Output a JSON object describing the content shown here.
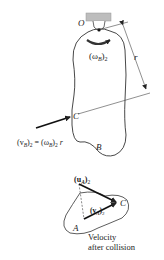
{
  "figure": {
    "upper": {
      "pivot_label": "O",
      "angular_velocity_label": "(ω",
      "angular_velocity_sub": "B",
      "angular_velocity_suffix": ")",
      "angular_velocity_post": "2",
      "radius_label": "r",
      "contact_point_label": "C",
      "body_label": "B",
      "velocity_eq": {
        "lhs_open": "(v",
        "lhs_sub": "B",
        "lhs_close": ")",
        "lhs_post": "2",
        "equals": " = (ω",
        "rhs_sub": "B",
        "rhs_close": ")",
        "rhs_post": "2",
        "rhs_r": " r"
      }
    },
    "lower": {
      "u_label_open": "(u",
      "u_label_sub": "A",
      "u_label_close": ")",
      "u_label_post": "2",
      "v_label_open": "(v",
      "v_label_sub": "A",
      "v_label_close": ")",
      "v_label_post": "2",
      "point_label": "C",
      "body_label": "A",
      "caption_line1": "Velocity",
      "caption_line2": "after collision"
    },
    "colors": {
      "ink": "#222222",
      "support": "#bbbbbb"
    }
  }
}
